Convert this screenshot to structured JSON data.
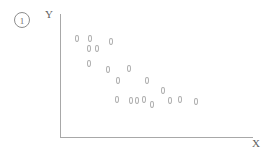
{
  "figure": {
    "number_label": "1",
    "name": "circled-figure-number"
  },
  "axes": {
    "y_label": "Y",
    "x_label": "X"
  },
  "chart_data": {
    "type": "scatter",
    "title": "",
    "subtitle": "",
    "xlabel": "X",
    "ylabel": "Y",
    "xlim": [
      0,
      100
    ],
    "ylim": [
      0,
      100
    ],
    "grid": false,
    "legend": null,
    "annotations": [
      "1"
    ],
    "marker": "open-oval",
    "marker_color": "#b0b0b0",
    "points": [
      {
        "x": 9,
        "y": 81
      },
      {
        "x": 16,
        "y": 81
      },
      {
        "x": 27,
        "y": 78
      },
      {
        "x": 15,
        "y": 73
      },
      {
        "x": 19,
        "y": 73
      },
      {
        "x": 15,
        "y": 61
      },
      {
        "x": 25,
        "y": 56
      },
      {
        "x": 36,
        "y": 57
      },
      {
        "x": 30,
        "y": 47
      },
      {
        "x": 45,
        "y": 47
      },
      {
        "x": 30,
        "y": 32
      },
      {
        "x": 40,
        "y": 31
      },
      {
        "x": 48,
        "y": 28
      },
      {
        "x": 53,
        "y": 39
      },
      {
        "x": 62,
        "y": 32
      },
      {
        "x": 70,
        "y": 30
      },
      {
        "x": 56,
        "y": 27
      },
      {
        "x": 42,
        "y": 30
      },
      {
        "x": 35,
        "y": 30
      }
    ],
    "pixel_points": [
      {
        "px": 77,
        "py": 38
      },
      {
        "px": 90,
        "py": 38
      },
      {
        "px": 111,
        "py": 41
      },
      {
        "px": 89,
        "py": 48
      },
      {
        "px": 97,
        "py": 48
      },
      {
        "px": 89,
        "py": 63
      },
      {
        "px": 108,
        "py": 69
      },
      {
        "px": 129,
        "py": 68
      },
      {
        "px": 118,
        "py": 80
      },
      {
        "px": 147,
        "py": 80
      },
      {
        "px": 117,
        "py": 99
      },
      {
        "px": 137,
        "py": 100
      },
      {
        "px": 152,
        "py": 104
      },
      {
        "px": 163,
        "py": 90
      },
      {
        "px": 180,
        "py": 99
      },
      {
        "px": 196,
        "py": 101
      },
      {
        "px": 170,
        "py": 100
      },
      {
        "px": 144,
        "py": 99
      },
      {
        "px": 131,
        "py": 100
      }
    ]
  }
}
